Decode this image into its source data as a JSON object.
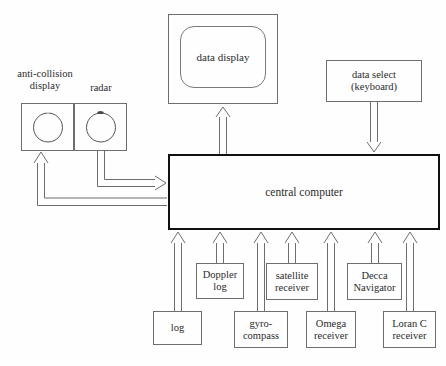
{
  "diagram": {
    "background_color": "#fefefe",
    "line_color": "#6e6e6e",
    "emphasis_color": "#111111",
    "text_color": "#2b2b2b"
  },
  "labels": {
    "anti_collision_display": "anti-collision\ndisplay",
    "anti_collision_line1": "anti-collision",
    "anti_collision_line2": "display",
    "radar": "radar"
  },
  "nodes": {
    "data_display": {
      "label": "data display",
      "x": 168,
      "y": 14,
      "w": 110,
      "h": 90
    },
    "data_select": {
      "label_line1": "data select",
      "label_line2": "(keyboard)",
      "x": 326,
      "y": 60,
      "w": 96,
      "h": 42
    },
    "central_computer": {
      "label": "central computer",
      "x": 168,
      "y": 154,
      "w": 272,
      "h": 76
    },
    "anti_collision": {
      "x": 21,
      "y": 103,
      "w": 53,
      "h": 48
    },
    "radar": {
      "x": 74,
      "y": 103,
      "w": 53,
      "h": 48
    }
  },
  "sensors": [
    {
      "name": "log",
      "label_line1": "log",
      "label_line2": "",
      "x": 153,
      "y": 311,
      "w": 49,
      "h": 34
    },
    {
      "name": "doppler-log",
      "label_line1": "Doppler",
      "label_line2": "log",
      "x": 196,
      "y": 263,
      "w": 48,
      "h": 36
    },
    {
      "name": "gyro-compass",
      "label_line1": "gyro-",
      "label_line2": "compass",
      "x": 234,
      "y": 311,
      "w": 54,
      "h": 37
    },
    {
      "name": "satellite-receiver",
      "label_line1": "satellite",
      "label_line2": "receiver",
      "x": 266,
      "y": 263,
      "w": 52,
      "h": 37
    },
    {
      "name": "omega-receiver",
      "label_line1": "Omega",
      "label_line2": "receiver",
      "x": 306,
      "y": 311,
      "w": 50,
      "h": 37
    },
    {
      "name": "decca-navigator",
      "label_line1": "Decca",
      "label_line2": "Navigator",
      "x": 347,
      "y": 263,
      "w": 55,
      "h": 37
    },
    {
      "name": "loran-c-receiver",
      "label_line1": "Loran C",
      "label_line2": "receiver",
      "x": 383,
      "y": 311,
      "w": 53,
      "h": 37
    }
  ],
  "connections": [
    {
      "from": "central-computer",
      "to": "data-display",
      "direction": "up"
    },
    {
      "from": "data-select",
      "to": "central-computer",
      "direction": "down"
    },
    {
      "from": "radar",
      "to": "central-computer",
      "direction": "right"
    },
    {
      "from": "central-computer",
      "to": "anti-collision-display",
      "direction": "up-left"
    },
    {
      "from": "log",
      "to": "central-computer",
      "direction": "up"
    },
    {
      "from": "doppler-log",
      "to": "central-computer",
      "direction": "up"
    },
    {
      "from": "gyro-compass",
      "to": "central-computer",
      "direction": "up"
    },
    {
      "from": "satellite-receiver",
      "to": "central-computer",
      "direction": "up"
    },
    {
      "from": "omega-receiver",
      "to": "central-computer",
      "direction": "up"
    },
    {
      "from": "decca-navigator",
      "to": "central-computer",
      "direction": "up"
    },
    {
      "from": "loran-c-receiver",
      "to": "central-computer",
      "direction": "up"
    }
  ]
}
